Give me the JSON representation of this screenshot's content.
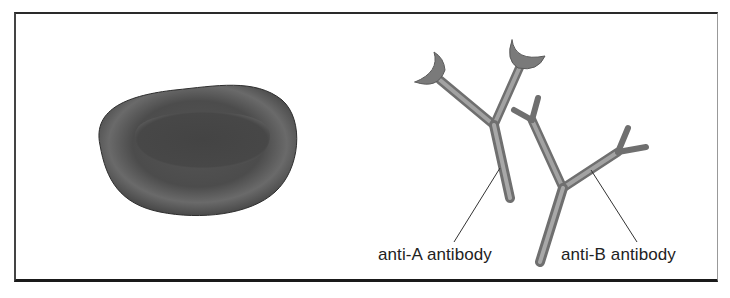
{
  "figure": {
    "cell": {
      "name": "red-blood-cell",
      "fill": "#4a4a4a"
    },
    "antibodies": [
      {
        "id": "anti-a",
        "label": "anti-A antibody",
        "tips": "crescent"
      },
      {
        "id": "anti-b",
        "label": "anti-B antibody",
        "tips": "forked"
      }
    ],
    "colors": {
      "antibody": "#8a8a8a",
      "antibody_dark": "#6a6a6a",
      "leader_line": "#333333",
      "frame": "#2a2a2a"
    }
  }
}
